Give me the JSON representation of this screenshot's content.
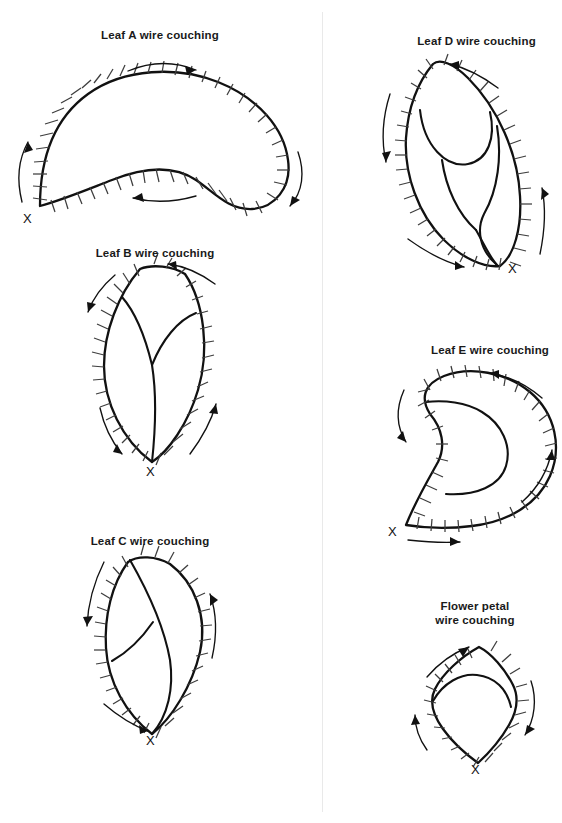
{
  "page": {
    "background_color": "#ffffff",
    "ink_color": "#111111",
    "tick_color": "#3d3d3d",
    "divider_color": "#e9e9e9",
    "width": 551,
    "height": 823,
    "start_mark_label": "X",
    "common_suffix": "wire couching"
  },
  "diagrams": [
    {
      "id": "leaf-a",
      "title": "Leaf A wire couching",
      "shape": "crescent",
      "start_mark": "X",
      "arrows": 3,
      "tick_count": 44,
      "has_veins": false
    },
    {
      "id": "leaf-b",
      "title": "Leaf B wire couching",
      "shape": "pointed-leaf",
      "start_mark": "X",
      "arrows": 3,
      "tick_count": 36,
      "has_veins": true
    },
    {
      "id": "leaf-c",
      "title": "Leaf C wire couching",
      "shape": "tilted-leaf",
      "start_mark": "X",
      "arrows": 2,
      "tick_count": 34,
      "has_veins": true
    },
    {
      "id": "leaf-d",
      "title": "Leaf D wire couching",
      "shape": "lobed-leaf",
      "start_mark": "X",
      "arrows": 4,
      "tick_count": 40,
      "has_veins": true
    },
    {
      "id": "leaf-e",
      "title": "Leaf E wire couching",
      "shape": "comma-crescent",
      "start_mark": "X",
      "arrows": 4,
      "tick_count": 38,
      "has_veins": true
    },
    {
      "id": "flower-petal",
      "title": "Flower petal\nwire couching",
      "shape": "kite-petal",
      "start_mark": "X",
      "arrows": 3,
      "tick_count": 24,
      "has_veins": true
    }
  ]
}
